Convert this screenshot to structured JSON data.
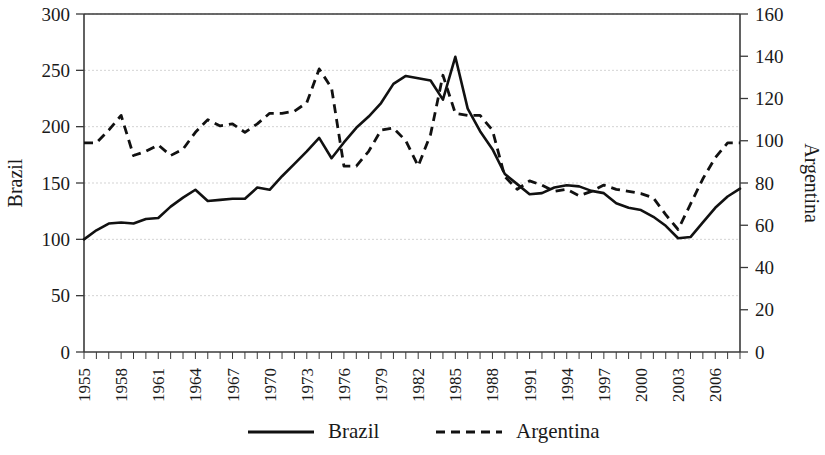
{
  "chart_data": {
    "type": "line",
    "title": "",
    "subtitle": "",
    "xlabel": "",
    "ylabel": "Brazil",
    "y2label": "Argentina",
    "grid": true,
    "legend_position": "bottom",
    "xlim": [
      1955,
      2008
    ],
    "ylim": [
      0,
      300
    ],
    "y2lim": [
      0,
      160
    ],
    "yticks": [
      0,
      50,
      100,
      150,
      200,
      250,
      300
    ],
    "y2ticks": [
      0,
      20,
      40,
      60,
      80,
      100,
      120,
      140,
      160
    ],
    "xticks": [
      1955,
      1958,
      1961,
      1964,
      1967,
      1970,
      1973,
      1976,
      1979,
      1982,
      1985,
      1988,
      1991,
      1994,
      1997,
      2000,
      2003,
      2006
    ],
    "xtick_labels": [
      "1955",
      "1958",
      "1961",
      "1964",
      "1967",
      "1970",
      "1973",
      "1976",
      "1979",
      "1982",
      "1985",
      "1988",
      "1991",
      "1994",
      "1997",
      "2000",
      "2003",
      "2006"
    ],
    "x": [
      1955,
      1956,
      1957,
      1958,
      1959,
      1960,
      1961,
      1962,
      1963,
      1964,
      1965,
      1966,
      1967,
      1968,
      1969,
      1970,
      1971,
      1972,
      1973,
      1974,
      1975,
      1976,
      1977,
      1978,
      1979,
      1980,
      1981,
      1982,
      1983,
      1984,
      1985,
      1986,
      1987,
      1988,
      1989,
      1990,
      1991,
      1992,
      1993,
      1994,
      1995,
      1996,
      1997,
      1998,
      1999,
      2000,
      2001,
      2002,
      2003,
      2004,
      2005,
      2006,
      2007,
      2008
    ],
    "series": [
      {
        "name": "Brazil",
        "axis": "left",
        "style": "solid",
        "color": "#111111",
        "values": [
          100,
          108,
          114,
          115,
          114,
          118,
          119,
          129,
          137,
          144,
          134,
          135,
          136,
          136,
          146,
          144,
          156,
          167,
          178,
          190,
          172,
          186,
          199,
          209,
          221,
          238,
          245,
          243,
          241,
          224,
          262,
          216,
          196,
          180,
          158,
          149,
          140,
          141,
          146,
          148,
          147,
          143,
          141,
          132,
          128,
          126,
          120,
          112,
          101,
          102,
          115,
          128,
          138,
          145
        ]
      },
      {
        "name": "Argentina",
        "axis": "right",
        "style": "dashed",
        "color": "#111111",
        "values": [
          99,
          99,
          105,
          112,
          93,
          95,
          98,
          93,
          96,
          104,
          110,
          107,
          108,
          104,
          108,
          113,
          113,
          114,
          118,
          134,
          125,
          88,
          88,
          95,
          105,
          106,
          100,
          88,
          103,
          131,
          113,
          112,
          112,
          105,
          83,
          77,
          81,
          79,
          76,
          77,
          74,
          76,
          79,
          77,
          76,
          75,
          73,
          65,
          58,
          70,
          82,
          92,
          99,
          99
        ]
      }
    ]
  },
  "legend": {
    "items": [
      {
        "label": "Brazil",
        "style": "solid"
      },
      {
        "label": "Argentina",
        "style": "dashed"
      }
    ]
  },
  "axes": {
    "left_title": "Brazil",
    "right_title": "Argentina"
  }
}
